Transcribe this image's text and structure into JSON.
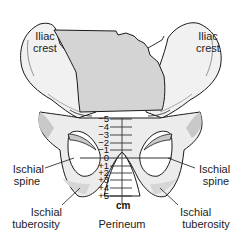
{
  "diagram": {
    "colors": {
      "bone_fill": "#f1f1f1",
      "sacrum_fill": "#d4d4d4",
      "shadow_fill": "#c8c8c8",
      "outline": "#1a1a1a",
      "scale_line": "#333333"
    },
    "labels": {
      "iliac_left": [
        "Iliac",
        "crest"
      ],
      "iliac_right": [
        "Iliac",
        "crest"
      ],
      "spine_left": [
        "Ischial",
        "spine"
      ],
      "spine_right": [
        "Ischial",
        "spine"
      ],
      "tuberosity_left": [
        "Ischial",
        "tuberosity"
      ],
      "tuberosity_right": [
        "Ischial",
        "tuberosity"
      ],
      "bottom": "Perineum"
    },
    "scale": {
      "unit": "cm",
      "stations": [
        "−5",
        "−4",
        "−3",
        "−2",
        "−1",
        "0",
        "+1",
        "+2",
        "+3",
        "+4",
        "+5"
      ]
    }
  }
}
